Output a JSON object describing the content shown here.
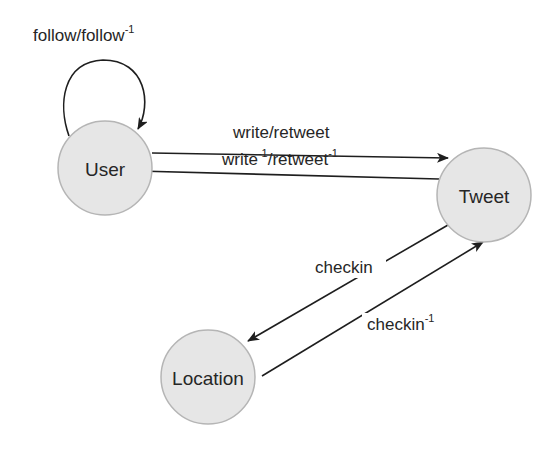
{
  "diagram": {
    "type": "state-graph",
    "nodes": [
      {
        "id": "user",
        "label": "User",
        "cx": 105,
        "cy": 168,
        "r": 47
      },
      {
        "id": "tweet",
        "label": "Tweet",
        "cx": 484,
        "cy": 195,
        "r": 47
      },
      {
        "id": "location",
        "label": "Location",
        "cx": 208,
        "cy": 377,
        "r": 47
      }
    ],
    "edges": [
      {
        "id": "follow",
        "from": "user",
        "to": "user",
        "label_main": "follow/follow",
        "label_sup": "-1"
      },
      {
        "id": "write-retweet",
        "from": "user",
        "to": "tweet",
        "label_main": "write/retweet",
        "label_sup": ""
      },
      {
        "id": "write-retweet-inverse",
        "from": "tweet",
        "to": "user",
        "label_part1": "write",
        "label_sup1": "-1",
        "label_part2": "/retweet",
        "label_sup2": "-1"
      },
      {
        "id": "checkin",
        "from": "tweet",
        "to": "location",
        "label_main": "checkin",
        "label_sup": ""
      },
      {
        "id": "checkin-inverse",
        "from": "location",
        "to": "tweet",
        "label_main": "checkin",
        "label_sup": "-1"
      }
    ]
  },
  "colors": {
    "node_fill": "#e6e6e6",
    "node_stroke": "#b5b5b5",
    "edge": "#1e1e1e",
    "text": "#262626",
    "background": "#ffffff"
  }
}
